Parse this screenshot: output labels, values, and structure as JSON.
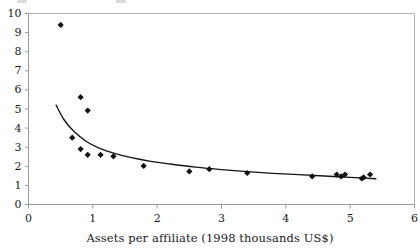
{
  "figure": {
    "name": "assets-per-affiliate-scatter",
    "background": "#ffffff",
    "marker_color": "#121212",
    "curve_color": "#151515",
    "axis_color": "#9a9a9a"
  },
  "axes": {
    "x_title": "Assets per affiliate (1998 thousands US$)",
    "y_title": "",
    "x_ticks": [
      "0",
      "1",
      "2",
      "3",
      "4",
      "5",
      "6"
    ],
    "y_ticks": [
      "0",
      "1",
      "2",
      "3",
      "4",
      "5",
      "6",
      "7",
      "8",
      "9",
      "10"
    ]
  },
  "chart_data": {
    "type": "scatter",
    "title": "",
    "xlabel": "Assets per affiliate (1998 thousands US$)",
    "ylabel": "",
    "xlim": [
      0,
      6
    ],
    "ylim": [
      0,
      10
    ],
    "xticks": [
      0,
      1,
      2,
      3,
      4,
      5,
      6
    ],
    "yticks": [
      0,
      1,
      2,
      3,
      4,
      5,
      6,
      7,
      8,
      9,
      10
    ],
    "grid": false,
    "legend": "none",
    "points": [
      {
        "x": 0.5,
        "y": 9.4
      },
      {
        "x": 0.81,
        "y": 5.62
      },
      {
        "x": 0.92,
        "y": 4.92
      },
      {
        "x": 0.68,
        "y": 3.5
      },
      {
        "x": 0.81,
        "y": 2.9
      },
      {
        "x": 0.92,
        "y": 2.6
      },
      {
        "x": 1.12,
        "y": 2.6
      },
      {
        "x": 1.32,
        "y": 2.52
      },
      {
        "x": 1.79,
        "y": 2.02
      },
      {
        "x": 2.5,
        "y": 1.73
      },
      {
        "x": 2.81,
        "y": 1.85
      },
      {
        "x": 3.4,
        "y": 1.65
      },
      {
        "x": 4.41,
        "y": 1.47
      },
      {
        "x": 4.79,
        "y": 1.57
      },
      {
        "x": 4.86,
        "y": 1.47
      },
      {
        "x": 4.92,
        "y": 1.57
      },
      {
        "x": 5.18,
        "y": 1.36
      },
      {
        "x": 5.21,
        "y": 1.42
      },
      {
        "x": 5.31,
        "y": 1.57
      }
    ],
    "trend_curve": {
      "label": "fitted power curve",
      "x": [
        0.43,
        0.55,
        0.7,
        0.9,
        1.1,
        1.35,
        1.6,
        1.9,
        2.2,
        2.6,
        3.0,
        3.4,
        3.8,
        4.2,
        4.6,
        5.0,
        5.4
      ],
      "y": [
        5.2,
        4.45,
        3.85,
        3.3,
        2.95,
        2.66,
        2.45,
        2.26,
        2.12,
        1.96,
        1.83,
        1.72,
        1.63,
        1.56,
        1.49,
        1.42,
        1.35
      ]
    }
  }
}
